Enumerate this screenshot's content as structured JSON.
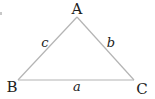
{
  "diagram": {
    "type": "triangle",
    "stroke_color": "#b4b4b4",
    "label_color": "#222222",
    "vertices": [
      {
        "name": "A",
        "x": 77,
        "y": 17,
        "label_x": 77,
        "label_y": 14
      },
      {
        "name": "B",
        "x": 18,
        "y": 80,
        "label_x": 12,
        "label_y": 92
      },
      {
        "name": "C",
        "x": 134,
        "y": 80,
        "label_x": 142,
        "label_y": 94
      }
    ],
    "sides": [
      {
        "name": "c",
        "from": "B",
        "to": "A",
        "label_x": 45,
        "label_y": 47
      },
      {
        "name": "b",
        "from": "A",
        "to": "C",
        "label_x": 111,
        "label_y": 47
      },
      {
        "name": "a",
        "from": "B",
        "to": "C",
        "label_x": 77,
        "label_y": 91
      }
    ]
  }
}
